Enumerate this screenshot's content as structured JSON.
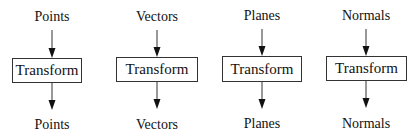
{
  "diagram": {
    "columns": [
      {
        "input": "Points",
        "process": "Transform",
        "output": "Points",
        "cx": 52,
        "box": {
          "x": 12,
          "y": 58,
          "w": 70,
          "h": 25
        }
      },
      {
        "input": "Vectors",
        "process": "Transform",
        "output": "Vectors",
        "cx": 157,
        "box": {
          "x": 116,
          "y": 57,
          "w": 82,
          "h": 25
        }
      },
      {
        "input": "Planes",
        "process": "Transform",
        "output": "Planes",
        "cx": 262,
        "box": {
          "x": 222,
          "y": 56,
          "w": 80,
          "h": 26
        }
      },
      {
        "input": "Normals",
        "process": "Transform",
        "output": "Normals",
        "cx": 366,
        "box": {
          "x": 326,
          "y": 56,
          "w": 81,
          "h": 25
        }
      }
    ]
  }
}
